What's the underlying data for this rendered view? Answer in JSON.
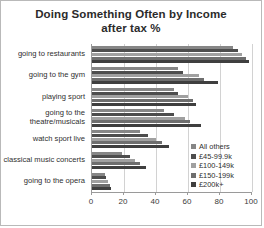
{
  "chart_data": {
    "type": "bar",
    "orientation": "horizontal",
    "title": "Doing Something Often by Income",
    "subtitle": "after tax %",
    "xlabel": "",
    "ylabel": "",
    "xlim": [
      0,
      100
    ],
    "xticks": [
      0,
      20,
      40,
      60,
      80,
      100
    ],
    "xtick_labels": [
      "0",
      "20",
      "40",
      "60",
      "80",
      "100"
    ],
    "grid": true,
    "legend_position": "center-right",
    "categories": [
      "going to restaurants",
      "going to the gym",
      "playing sport",
      "going to the\ntheatre/musicals",
      "watch sport live",
      "classical music concerts",
      "going to the opera"
    ],
    "series": [
      {
        "name": "All others",
        "color": "#868686",
        "values": [
          88,
          54,
          51,
          45,
          30,
          19,
          8
        ]
      },
      {
        "name": "£45-99.9k",
        "color": "#4d4d4d",
        "values": [
          91,
          57,
          54,
          51,
          35,
          24,
          9
        ]
      },
      {
        "name": "£100-149k",
        "color": "#a0a0a0",
        "values": [
          94,
          67,
          60,
          58,
          40,
          27,
          10
        ]
      },
      {
        "name": "£150-199k",
        "color": "#6e6e6e",
        "values": [
          96,
          70,
          63,
          61,
          44,
          30,
          11
        ]
      },
      {
        "name": "£200k+",
        "color": "#3f3f3f",
        "values": [
          98,
          79,
          65,
          68,
          48,
          34,
          12
        ]
      }
    ]
  },
  "legend": {
    "items": [
      "All others",
      "£45-99.9k",
      "£100-149k",
      "£150-199k",
      "£200k+"
    ]
  },
  "axis": {
    "tick_labels": [
      "0",
      "20",
      "40",
      "60",
      "80",
      "100"
    ]
  },
  "title": {
    "line1": "Doing Something Often by Income",
    "line2": "after tax %"
  }
}
